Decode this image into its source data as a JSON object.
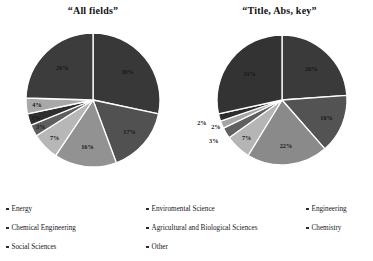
{
  "chart_data": [
    {
      "type": "pie",
      "title": "“All fields”",
      "legend_position": "bottom",
      "categories": [
        "Energy",
        "Enviromental Science",
        "Engineering",
        "Chemical Engineering",
        "Agricultural and Biological Sciences",
        "Chemistry",
        "Social Sciences",
        "Other"
      ],
      "values": [
        30,
        17,
        16,
        7,
        3,
        3,
        4,
        26
      ],
      "labels": [
        "30%",
        "17%",
        "16%",
        "7%",
        "3%",
        "3%",
        "4%",
        "26%"
      ],
      "colors": [
        "#383838",
        "#515151",
        "#929292",
        "#b7b7b7",
        "#5e5e5e",
        "#2f2f2f",
        "#a8a8a8",
        "#3c3c3c"
      ],
      "start_angle_deg": 0,
      "direction": "clockwise"
    },
    {
      "type": "pie",
      "title": "“Title, Abs, key”",
      "legend_position": "bottom",
      "categories": [
        "Energy",
        "Enviromental Science",
        "Engineering",
        "Chemical Engineering",
        "Agricultural and Biological Sciences",
        "Chemistry",
        "Social Sciences",
        "Other"
      ],
      "values": [
        26,
        16,
        22,
        7,
        3,
        2,
        2,
        31
      ],
      "labels": [
        "26%",
        "16%",
        "22%",
        "7%",
        "3%",
        "2%",
        "2%",
        "31%"
      ],
      "colors": [
        "#3a3a3a",
        "#535353",
        "#8a8a8a",
        "#b5b5b5",
        "#606060",
        "#a5a5a5",
        "#2c2c2c",
        "#333333"
      ],
      "start_angle_deg": 0,
      "direction": "clockwise"
    }
  ],
  "legend": {
    "items": [
      {
        "label": "Energy"
      },
      {
        "label": "Enviromental Science"
      },
      {
        "label": "Engineering"
      },
      {
        "label": "Chemical Engineering"
      },
      {
        "label": "Agricultural and Biological Sciences"
      },
      {
        "label": "Chemistry"
      },
      {
        "label": "Social Sciences"
      },
      {
        "label": "Other"
      }
    ]
  },
  "colors": {
    "background": "#ffffff",
    "text": "#17171c",
    "slice_divider": "#ffffff"
  }
}
